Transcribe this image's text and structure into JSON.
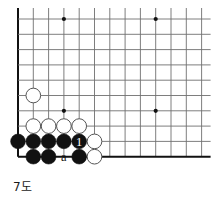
{
  "figure": {
    "caption": "7도",
    "kind": "go-board-diagram",
    "board_region": "lower-left corner"
  },
  "board": {
    "origin_x": 18,
    "origin_y": 19,
    "spacing": 15.3,
    "cols_visible": 13,
    "rows_visible": 10,
    "edge_left": true,
    "edge_bottom": true,
    "line_color": "#6f6f6f",
    "edge_color": "#111111",
    "star_point_color": "#111111",
    "star_points": [
      {
        "col": 3,
        "row": 0
      },
      {
        "col": 9,
        "row": 0
      },
      {
        "col": 3,
        "row": 6
      },
      {
        "col": 9,
        "row": 6
      }
    ]
  },
  "stones": [
    {
      "id": "w-a",
      "color": "white",
      "col": 1,
      "row": 5,
      "label": ""
    },
    {
      "id": "w-b",
      "color": "white",
      "col": 1,
      "row": 7,
      "label": ""
    },
    {
      "id": "w-c",
      "color": "white",
      "col": 2,
      "row": 7,
      "label": ""
    },
    {
      "id": "w-d",
      "color": "white",
      "col": 3,
      "row": 7,
      "label": ""
    },
    {
      "id": "w-e",
      "color": "white",
      "col": 4,
      "row": 7,
      "label": ""
    },
    {
      "id": "b-a",
      "color": "black",
      "col": 0,
      "row": 8,
      "label": ""
    },
    {
      "id": "b-b",
      "color": "black",
      "col": 1,
      "row": 8,
      "label": ""
    },
    {
      "id": "b-c",
      "color": "black",
      "col": 2,
      "row": 8,
      "label": ""
    },
    {
      "id": "b-d",
      "color": "black",
      "col": 3,
      "row": 8,
      "label": ""
    },
    {
      "id": "b-move-1",
      "color": "black",
      "col": 4,
      "row": 8,
      "label": "1"
    },
    {
      "id": "w-f",
      "color": "white",
      "col": 5,
      "row": 8,
      "label": ""
    },
    {
      "id": "b-e",
      "color": "black",
      "col": 1,
      "row": 9,
      "label": ""
    },
    {
      "id": "b-f",
      "color": "black",
      "col": 2,
      "row": 9,
      "label": ""
    },
    {
      "id": "b-g",
      "color": "black",
      "col": 4,
      "row": 9,
      "label": ""
    },
    {
      "id": "w-g",
      "color": "white",
      "col": 5,
      "row": 9,
      "label": ""
    }
  ],
  "point_labels": [
    {
      "id": "point-a",
      "text": "a",
      "col": 3,
      "row": 9
    }
  ],
  "colors": {
    "black_stone": "#111111",
    "white_stone_fill": "#ffffff",
    "white_stone_stroke": "#555555",
    "move_number_on_black": "#ffffff",
    "label_text": "#111111",
    "background": "#ffffff"
  }
}
